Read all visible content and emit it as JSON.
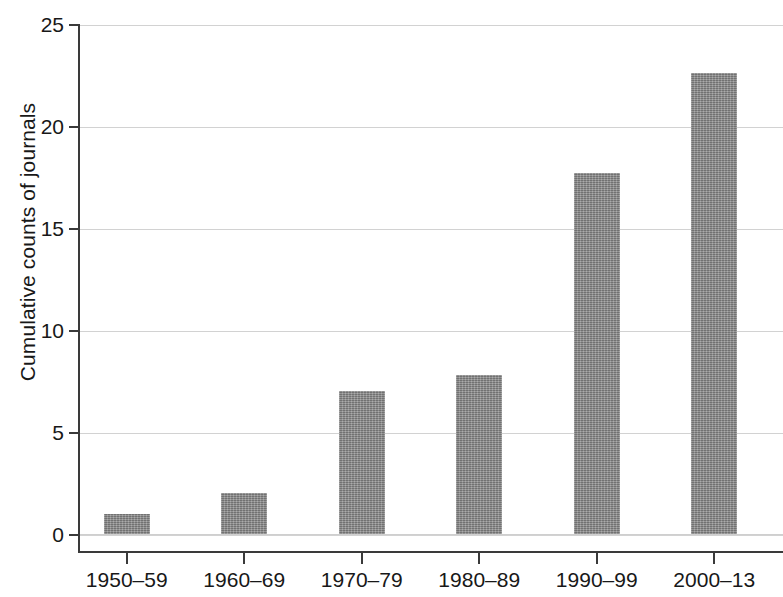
{
  "chart_data": {
    "type": "bar",
    "title": "",
    "xlabel": "",
    "ylabel": "Cumulative counts of journals",
    "categories": [
      "1950–59",
      "1960–69",
      "1970–79",
      "1980–89",
      "1990–99",
      "2000–13"
    ],
    "values": [
      1,
      2,
      7,
      7.8,
      17.7,
      22.6
    ],
    "ylim": [
      0,
      25
    ],
    "ytick_labels": [
      "0",
      "5",
      "10",
      "15",
      "20",
      "25"
    ],
    "ytick_values": [
      0,
      5,
      10,
      15,
      20,
      25
    ],
    "grid": "horizontal",
    "legend": "none",
    "series": [
      {
        "name": "Cumulative counts of journals",
        "values": [
          1,
          2,
          7,
          7.8,
          17.7,
          22.6
        ]
      }
    ]
  },
  "style": {
    "bar_color": "#8b8b8b",
    "axis_color": "#3a3a3a",
    "grid_color": "#d2d2d2",
    "background": "#ffffff",
    "text_color": "#181818"
  }
}
